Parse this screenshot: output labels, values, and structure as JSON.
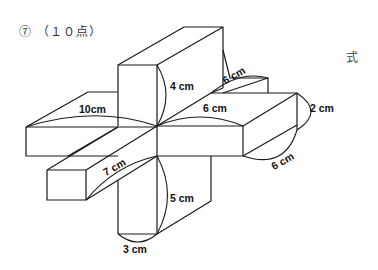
{
  "header": {
    "problem_number": "⑦",
    "points": "（１０点）",
    "answer_label": "式"
  },
  "figure": {
    "labels": {
      "top_height": "4 cm",
      "top_right_depth": "6 cm",
      "right_length": "6 cm",
      "right_height": "2 cm",
      "right_depth": "6 cm",
      "left_length": "10cm",
      "front_length": "7 cm",
      "bottom_height": "5 cm",
      "bottom_width": "3 cm"
    }
  }
}
